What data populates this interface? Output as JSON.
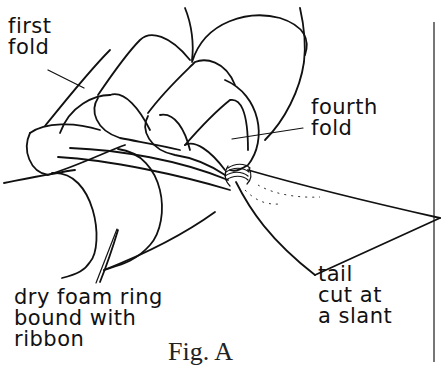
{
  "figure": {
    "caption": "Fig. A",
    "labels": {
      "first_fold": "first\nfold",
      "fourth_fold": "fourth\nfold",
      "foam_ring": "dry foam ring\nbound with\nribbon",
      "tail": "tail\ncut at\na slant"
    },
    "line_color": "#111111",
    "background": "#ffffff"
  }
}
